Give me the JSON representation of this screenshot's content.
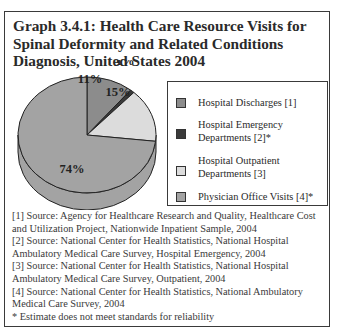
{
  "title": "Graph 3.4.1: Health Care Resource Visits for Spinal Deformity and Related Conditions Diagnosis, United States 2004",
  "chart_data": {
    "type": "pie",
    "title": "Graph 3.4.1: Health Care Resource Visits for Spinal Deformity and Related Conditions Diagnosis, United States 2004",
    "style": "3d",
    "categories": [
      "Hospital Discharges [1]",
      "Hospital Emergency Departments [2]*",
      "Hospital Outpatient Departments [3]",
      "Physician Office Visits [4]*"
    ],
    "values": [
      11,
      1,
      15,
      74
    ],
    "data_labels": [
      "11%",
      "1%",
      "15%",
      "74%"
    ],
    "colors": [
      "#8c8c8c",
      "#3a3a3a",
      "#dcdcdc",
      "#a3a3a3"
    ],
    "legend_position": "right"
  },
  "legend": {
    "items": [
      {
        "label_lines": [
          "Hospital Discharges [1]"
        ],
        "color": "#8c8c8c"
      },
      {
        "label_lines": [
          "Hospital Emergency",
          "Departments [2]*"
        ],
        "color": "#3a3a3a"
      },
      {
        "label_lines": [
          "Hospital Outpatient",
          "Departments [3]"
        ],
        "color": "#dcdcdc"
      },
      {
        "label_lines": [
          "Physician Office Visits [4]*"
        ],
        "color": "#a3a3a3"
      }
    ]
  },
  "notes": [
    "[1] Source: Agency for Healthcare Research and Quality, Healthcare Cost and Utilization Project, Nationwide Inpatient Sample, 2004",
    "[2] Source: National Center for Health Statistics, National Hospital Ambulatory Medical Care Survey, Hospital Emergency, 2004",
    "[3] Source: National Center for Health Statistics, National Hospital Ambulatory Medical Care Survey, Outpatient, 2004",
    "[4] Source: National Center for Health Statistics, National Ambulatory Medical Care Survey, 2004",
    "* Estimate does not meet standards for reliability"
  ]
}
